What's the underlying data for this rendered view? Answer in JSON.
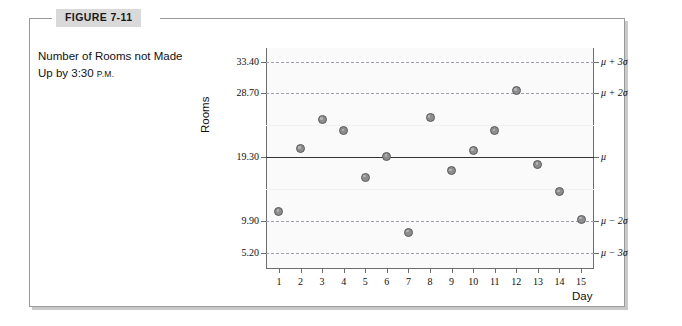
{
  "figure": {
    "tag": "FIGURE 7-11",
    "caption_line1": "Number of Rooms not Made",
    "caption_line2_pre": "Up by 3:30 ",
    "caption_line2_smallcaps": "P.M."
  },
  "chart_data": {
    "type": "scatter",
    "title": "Number of Rooms not Made Up by 3:30 P.M.",
    "xlabel": "Day",
    "ylabel": "Rooms",
    "x": [
      1,
      2,
      3,
      4,
      5,
      6,
      7,
      8,
      9,
      10,
      11,
      12,
      13,
      14,
      15
    ],
    "values": [
      11.35,
      20.6,
      24.9,
      23.2,
      16.4,
      19.4,
      8.3,
      25.2,
      17.3,
      20.3,
      23.2,
      29.1,
      18.2,
      14.2,
      10.2
    ],
    "categories": [
      "1",
      "2",
      "3",
      "4",
      "5",
      "6",
      "7",
      "8",
      "9",
      "10",
      "11",
      "12",
      "13",
      "14",
      "15"
    ],
    "ylim": [
      3.0,
      35.4
    ],
    "xlim": [
      0.4,
      15.6
    ],
    "grid": false,
    "legend": "none",
    "y_tick_labels": [
      "33.40",
      "28.70",
      "19.30",
      "9.90",
      "5.20"
    ],
    "y_tick_values": [
      33.4,
      28.7,
      19.3,
      9.9,
      5.2
    ],
    "right_labels": [
      "μ + 3σ",
      "μ + 2σ",
      "μ",
      "μ − 2σ",
      "μ − 3σ"
    ],
    "control_lines": [
      {
        "label": "μ + 3σ",
        "value": 33.4,
        "style": "dashed"
      },
      {
        "label": "μ + 2σ",
        "value": 28.7,
        "style": "dashed"
      },
      {
        "label": "μ + 1σ",
        "value": 24.0,
        "style": "faint"
      },
      {
        "label": "μ",
        "value": 19.3,
        "style": "solid"
      },
      {
        "label": "μ − 1σ",
        "value": 14.6,
        "style": "faint"
      },
      {
        "label": "μ − 2σ",
        "value": 9.9,
        "style": "dashed"
      },
      {
        "label": "μ − 3σ",
        "value": 5.2,
        "style": "dashed"
      }
    ],
    "colors": {
      "marker_fill": "#8d8d8d",
      "marker_edge": "#5c5c5c",
      "mean_line": "#333333",
      "sigma_line": "#9d9dad",
      "plot_bg": "#fafafa",
      "frame": "#9a9a9a",
      "tag_bg": "#d9d9d9"
    }
  },
  "axis": {
    "y_title": "Rooms",
    "x_title": "Day"
  }
}
